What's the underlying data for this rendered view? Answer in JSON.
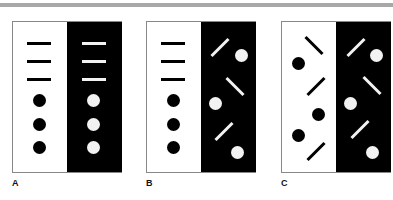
{
  "figure": {
    "panels": [
      {
        "label": "A",
        "description": "Left half white with three black horizontal bars above three black dots; right half black with three white horizontal bars above three white dots"
      },
      {
        "label": "B",
        "description": "Left half identical to A; right half black with white tilted bars and white dots scattered"
      },
      {
        "label": "C",
        "description": "Both halves scattered: left white with black tilted bars and black dots; right black with white tilted bars and white dots"
      }
    ]
  }
}
